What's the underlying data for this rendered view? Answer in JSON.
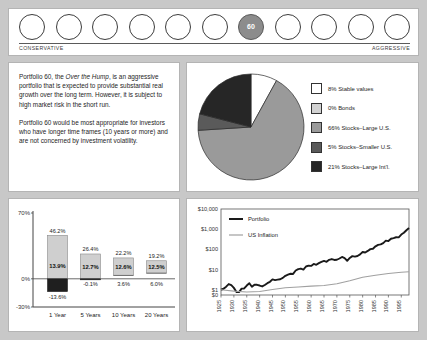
{
  "risk_scale": {
    "circle_count": 11,
    "active_index": 6,
    "active_label": "60",
    "left_label": "CONSERVATIVE",
    "right_label": "AGGRESSIVE"
  },
  "description": {
    "para1_a": "Portfolio 60, the ",
    "para1_italic": "Over the Hump",
    "para1_b": ", is an aggressive portfolio that is expected to provide substantial real growth over the long term. However, it is subject to high market risk in the short run.",
    "para2": "Portfolio 60 would be most appropriate for investors who have longer time frames (10 years or more) and are not concerned by investment volatility."
  },
  "chart_data": [
    {
      "type": "pie",
      "title": "",
      "legend_position": "right",
      "slices": [
        {
          "label": "8% Stable values",
          "value": 8,
          "color": "#ffffff"
        },
        {
          "label": "0% Bonds",
          "value": 0,
          "color": "#d2d2d2"
        },
        {
          "label": "66% Stocks–Large U.S.",
          "value": 66,
          "color": "#9a9a9a"
        },
        {
          "label": "5% Stocks–Smaller U.S.",
          "value": 5,
          "color": "#5a5a5a"
        },
        {
          "label": "21% Stocks–Large Int'l.",
          "value": 21,
          "color": "#262626"
        }
      ]
    },
    {
      "type": "bar",
      "title": "",
      "xlabel": "",
      "ylabel": "",
      "ylim": [
        -30,
        70
      ],
      "yticks": [
        "70%",
        "0%",
        "-30%"
      ],
      "ytick_values": [
        70,
        0,
        -30
      ],
      "grid": false,
      "categories": [
        "1 Year",
        "5 Years",
        "10 Years",
        "20 Years"
      ],
      "series": [
        {
          "name": "Best",
          "values": [
            46.2,
            26.4,
            22.2,
            19.2
          ],
          "labels": [
            "46.2%",
            "26.4%",
            "22.2%",
            "19.2%"
          ]
        },
        {
          "name": "Average",
          "values": [
            13.9,
            12.7,
            12.6,
            12.5
          ],
          "labels": [
            "13.9%",
            "12.7%",
            "12.6%",
            "12.5%"
          ]
        },
        {
          "name": "Worst",
          "values": [
            -13.6,
            -0.1,
            3.6,
            6.0
          ],
          "labels": [
            "-13.6%",
            "-0.1%",
            "3.6%",
            "6.0%"
          ]
        }
      ]
    },
    {
      "type": "line",
      "title": "",
      "xlabel": "",
      "ylabel": "",
      "y_log": true,
      "yticks": [
        "$10,000",
        "$1,000",
        "$100",
        "$10",
        "$1",
        "$0"
      ],
      "xticks": [
        "1925",
        "1930",
        "1935",
        "1940",
        "1945",
        "1950",
        "1955",
        "1960",
        "1965",
        "1970",
        "1975",
        "1980",
        "1985",
        "1990",
        "1995"
      ],
      "legend": [
        {
          "name": "Portfolio",
          "color": "#1a1a1a"
        },
        {
          "name": "US Inflation",
          "color": "#a0a0a0"
        }
      ],
      "series": [
        {
          "name": "Portfolio",
          "color": "#1a1a1a",
          "x": [
            1925,
            1926,
            1927,
            1928,
            1929,
            1930,
            1931,
            1932,
            1933,
            1934,
            1935,
            1936,
            1937,
            1938,
            1939,
            1940,
            1941,
            1942,
            1943,
            1944,
            1945,
            1946,
            1947,
            1948,
            1949,
            1950,
            1951,
            1952,
            1953,
            1954,
            1955,
            1956,
            1957,
            1958,
            1959,
            1960,
            1961,
            1962,
            1963,
            1964,
            1965,
            1966,
            1967,
            1968,
            1969,
            1970,
            1971,
            1972,
            1973,
            1974,
            1975,
            1976,
            1977,
            1978,
            1979,
            1980,
            1981,
            1982,
            1983,
            1984,
            1985,
            1986,
            1987,
            1988,
            1989,
            1990,
            1991,
            1992,
            1993,
            1994,
            1995,
            1996,
            1997,
            1998
          ],
          "y": [
            1.0,
            1.12,
            1.42,
            1.92,
            1.7,
            1.24,
            0.78,
            0.76,
            1.14,
            1.16,
            1.62,
            2.1,
            1.4,
            1.78,
            1.76,
            1.62,
            1.46,
            1.72,
            2.12,
            2.48,
            3.28,
            3.02,
            3.16,
            3.32,
            3.88,
            4.9,
            5.62,
            6.2,
            6.08,
            9.0,
            10.6,
            11.2,
            10.0,
            14.2,
            15.6,
            15.2,
            19.0,
            17.2,
            20.8,
            24.0,
            26.8,
            24.2,
            30.4,
            33.2,
            30.0,
            30.6,
            35.4,
            42.2,
            36.6,
            27.2,
            37.8,
            46.4,
            43.6,
            47.0,
            56.6,
            74.0,
            70.0,
            84.0,
            103,
            108,
            142,
            168,
            176,
            205,
            270,
            258,
            336,
            362,
            398,
            394,
            540,
            664,
            886,
            1140
          ]
        },
        {
          "name": "US Inflation",
          "color": "#a0a0a0",
          "x": [
            1925,
            1930,
            1935,
            1940,
            1945,
            1950,
            1955,
            1960,
            1965,
            1970,
            1975,
            1980,
            1985,
            1990,
            1995,
            1998
          ],
          "y": [
            1.0,
            0.86,
            0.78,
            0.82,
            1.02,
            1.26,
            1.38,
            1.52,
            1.62,
            1.98,
            2.78,
            4.18,
            5.22,
            6.34,
            7.32,
            7.8
          ]
        }
      ]
    }
  ]
}
